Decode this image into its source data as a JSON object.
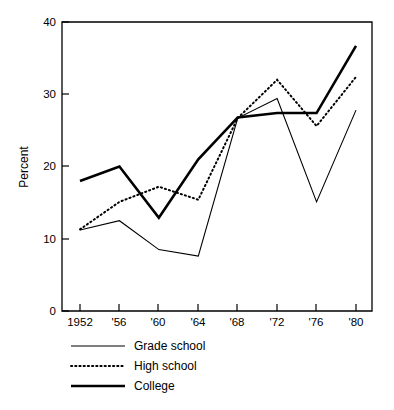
{
  "chart_data": {
    "type": "line",
    "title": "",
    "xlabel": "",
    "ylabel": "Percent",
    "x": [
      "1952",
      "'56",
      "'60",
      "'64",
      "'68",
      "'72",
      "'76",
      "'80"
    ],
    "categories": [
      "1952",
      "'56",
      "'60",
      "'64",
      "'68",
      "'72",
      "'76",
      "'80"
    ],
    "xlim": [
      1952,
      1980
    ],
    "ylim": [
      0,
      40
    ],
    "yticks": [
      "0",
      "10",
      "20",
      "30",
      "40"
    ],
    "ytick_values": [
      0,
      10,
      20,
      30,
      40
    ],
    "grid": false,
    "legend_position": "below-left",
    "series": [
      {
        "name": "Grade school",
        "style": "thin-solid",
        "color": "#000000",
        "values": [
          11.2,
          12.5,
          8.5,
          7.6,
          26.7,
          29.4,
          15.1,
          27.8
        ]
      },
      {
        "name": "High school",
        "style": "dotted",
        "color": "#000000",
        "values": [
          11.3,
          15.1,
          17.2,
          15.4,
          26.7,
          32.0,
          25.6,
          32.4
        ]
      },
      {
        "name": "College",
        "style": "thick-solid",
        "color": "#000000",
        "values": [
          18.0,
          20.0,
          12.9,
          21.0,
          26.8,
          27.4,
          27.4,
          36.7
        ]
      }
    ]
  },
  "axes": {
    "y_title": "Percent",
    "y_ticks": [
      "40",
      "30",
      "20",
      "10",
      "0"
    ],
    "x_ticks": [
      "1952",
      "'56",
      "'60",
      "'64",
      "'68",
      "'72",
      "'76",
      "'80"
    ]
  },
  "legend": {
    "entries": [
      {
        "label": "Grade school"
      },
      {
        "label": "High school"
      },
      {
        "label": "College"
      }
    ]
  }
}
